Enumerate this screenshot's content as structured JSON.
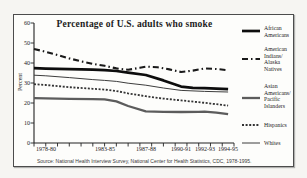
{
  "chart_data": {
    "type": "line",
    "title": "Percentage of U.S. adults who smoke",
    "ylabel": "Percent",
    "source": "Source: National Health Interview Survey, National Center for Health Statistics, CDC, 1978-1995.",
    "xlim": [
      1978,
      1995
    ],
    "ylim": [
      0,
      60
    ],
    "ytick_step": 10,
    "grid": false,
    "legend_position": "right",
    "axis_color": "#222222",
    "ytick_labels": [
      "60",
      "50",
      "40",
      "30",
      "20",
      "10",
      "0"
    ],
    "xtick_labels": [
      {
        "label": "1978-80",
        "x": 1979
      },
      {
        "label": "1983-85",
        "x": 1984
      },
      {
        "label": "1987-88",
        "x": 1987.5
      },
      {
        "label": "1990-91",
        "x": 1990.5
      },
      {
        "label": "1992-93",
        "x": 1992.5
      },
      {
        "label": "1994-95",
        "x": 1994.5
      }
    ],
    "series": [
      {
        "name": "African Americans",
        "legend_lines": [
          "African",
          "Americans"
        ],
        "color": "#0d0d0d",
        "stroke_width": 2.7,
        "dash": "",
        "points": [
          [
            1978,
            37.4
          ],
          [
            1979,
            37.2
          ],
          [
            1981,
            36.9
          ],
          [
            1983,
            36.7
          ],
          [
            1984,
            36.4
          ],
          [
            1985,
            36.0
          ],
          [
            1986,
            35.2
          ],
          [
            1987.5,
            34.0
          ],
          [
            1989,
            31.3
          ],
          [
            1990.5,
            28.2
          ],
          [
            1991.5,
            27.6
          ],
          [
            1992.5,
            27.4
          ],
          [
            1993.5,
            27.2
          ],
          [
            1994.5,
            26.9
          ]
        ]
      },
      {
        "name": "American Indians/Alaska Natives",
        "legend_lines": [
          "American",
          "Indians/",
          "Alaska",
          "Natives"
        ],
        "color": "#1a1a1a",
        "stroke_width": 2.1,
        "dash": "6 3 1.5 3",
        "points": [
          [
            1978,
            47.0
          ],
          [
            1979,
            45.6
          ],
          [
            1980,
            44.0
          ],
          [
            1981,
            42.3
          ],
          [
            1982,
            40.8
          ],
          [
            1983,
            39.6
          ],
          [
            1984,
            38.6
          ],
          [
            1985,
            37.3
          ],
          [
            1986,
            36.6
          ],
          [
            1987,
            37.6
          ],
          [
            1987.5,
            38.2
          ],
          [
            1988.5,
            37.9
          ],
          [
            1989.5,
            36.8
          ],
          [
            1990.5,
            35.5
          ],
          [
            1991.5,
            36.2
          ],
          [
            1992.5,
            37.3
          ],
          [
            1993.5,
            37.0
          ],
          [
            1994.5,
            36.4
          ]
        ]
      },
      {
        "name": "Asian Americans/Pacific Islanders",
        "legend_lines": [
          "Asian",
          "Americans/",
          "Pacific",
          "Islanders"
        ],
        "color": "#5c5c5c",
        "stroke_width": 2.3,
        "dash": "",
        "points": [
          [
            1978,
            22.4
          ],
          [
            1979,
            22.3
          ],
          [
            1981,
            22.1
          ],
          [
            1983,
            21.9
          ],
          [
            1984,
            21.8
          ],
          [
            1985,
            20.8
          ],
          [
            1986,
            18.5
          ],
          [
            1987.5,
            15.8
          ],
          [
            1989,
            15.6
          ],
          [
            1990.5,
            15.5
          ],
          [
            1992,
            15.6
          ],
          [
            1992.5,
            15.7
          ],
          [
            1993.5,
            15.2
          ],
          [
            1994.5,
            14.4
          ]
        ]
      },
      {
        "name": "Hispanics",
        "legend_lines": [
          "Hispanics"
        ],
        "color": "#333333",
        "stroke_width": 1.8,
        "dash": "2 1.6",
        "points": [
          [
            1978,
            29.4
          ],
          [
            1979,
            29.0
          ],
          [
            1981,
            27.9
          ],
          [
            1983,
            27.1
          ],
          [
            1984,
            26.7
          ],
          [
            1985,
            26.0
          ],
          [
            1986,
            24.8
          ],
          [
            1987.5,
            23.4
          ],
          [
            1989,
            22.2
          ],
          [
            1990.5,
            21.3
          ],
          [
            1992.5,
            20.1
          ],
          [
            1993.5,
            19.4
          ],
          [
            1994.5,
            18.7
          ]
        ]
      },
      {
        "name": "Whites",
        "legend_lines": [
          "Whites"
        ],
        "color": "#3d3d3d",
        "stroke_width": 1,
        "dash": "",
        "points": [
          [
            1978,
            33.9
          ],
          [
            1979,
            33.6
          ],
          [
            1981,
            32.7
          ],
          [
            1983,
            31.7
          ],
          [
            1984,
            31.3
          ],
          [
            1985,
            30.8
          ],
          [
            1986,
            29.9
          ],
          [
            1987.5,
            28.9
          ],
          [
            1989,
            27.5
          ],
          [
            1990.5,
            26.3
          ],
          [
            1992.5,
            25.8
          ],
          [
            1994.5,
            25.5
          ]
        ]
      }
    ]
  }
}
